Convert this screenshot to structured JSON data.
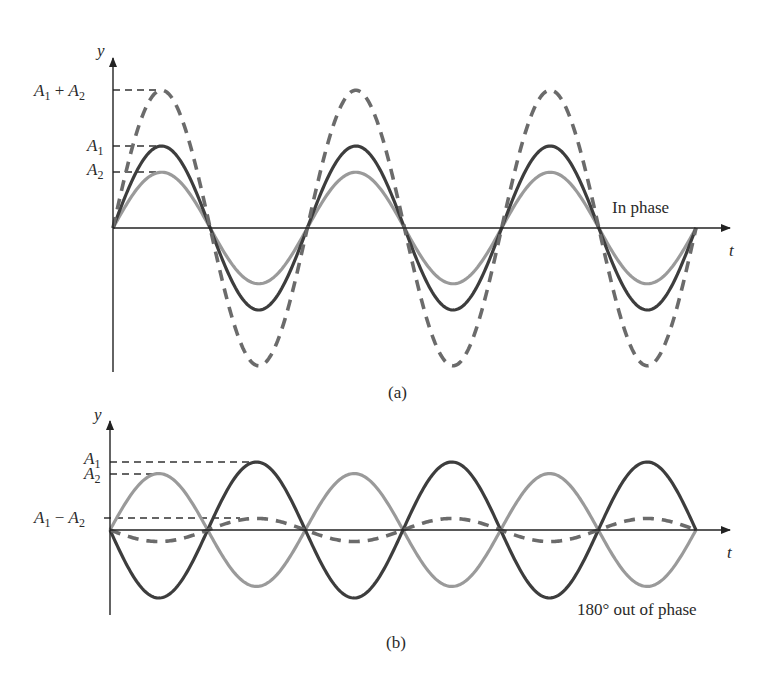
{
  "figure": {
    "panel_a": {
      "caption": "(a)",
      "annotation": "In phase",
      "y_axis_label": "y",
      "x_axis_label": "t",
      "levels": {
        "sum": "A1 + A2",
        "a1": "A1",
        "a2": "A2"
      }
    },
    "panel_b": {
      "caption": "(b)",
      "annotation": "180° out of phase",
      "y_axis_label": "y",
      "x_axis_label": "t",
      "levels": {
        "a1": "A1",
        "a2": "A2",
        "diff": "A1 − A2"
      }
    },
    "colors": {
      "wave_a1": "#3d3d3d",
      "wave_a2": "#9a9a9a",
      "resultant": "#6b6b6b",
      "axis": "#222222"
    }
  },
  "chart_data": [
    {
      "type": "line",
      "title": "(a) In phase",
      "xlabel": "t",
      "ylabel": "y",
      "half_periods": 6,
      "series": [
        {
          "name": "A1 wave",
          "amplitude": 1.0,
          "phase_deg": 0,
          "style": "solid dark"
        },
        {
          "name": "A2 wave",
          "amplitude": 0.68,
          "phase_deg": 0,
          "style": "solid light"
        },
        {
          "name": "Resultant (A1 + A2)",
          "amplitude": 1.68,
          "phase_deg": 0,
          "style": "dashed"
        }
      ],
      "annotations": [
        "A1 + A2",
        "A1",
        "A2",
        "In phase"
      ]
    },
    {
      "type": "line",
      "title": "(b) 180° out of phase",
      "xlabel": "t",
      "ylabel": "y",
      "half_periods": 6,
      "series": [
        {
          "name": "A1 wave",
          "amplitude": 1.0,
          "phase_deg": 180,
          "style": "solid dark"
        },
        {
          "name": "A2 wave",
          "amplitude": 0.83,
          "phase_deg": 0,
          "style": "solid light"
        },
        {
          "name": "Resultant (A1 − A2)",
          "amplitude": 0.17,
          "phase_deg": 180,
          "style": "dashed"
        }
      ],
      "annotations": [
        "A1",
        "A2",
        "A1 − A2",
        "180° out of phase"
      ]
    }
  ]
}
